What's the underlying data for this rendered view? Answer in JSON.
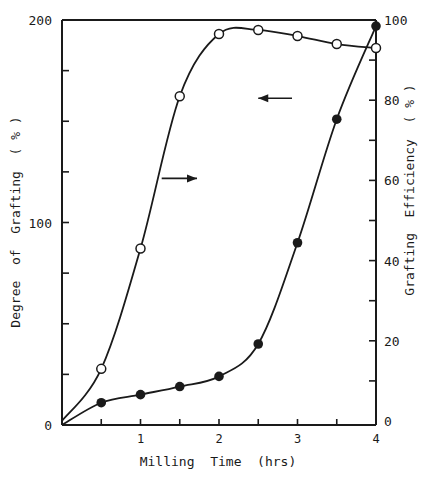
{
  "chart_data": {
    "type": "line",
    "title": "",
    "xlabel": "Milling Time (hrs)",
    "ylabel_left": "Degree of Grafting ( % )",
    "ylabel_right": "Grafting Efficiency ( % )",
    "x": [
      0,
      0.5,
      1,
      1.5,
      2,
      2.5,
      3,
      3.5,
      4
    ],
    "xlim": [
      0,
      4
    ],
    "ylim_left": [
      0,
      200
    ],
    "ylim_right": [
      0,
      100
    ],
    "x_ticks": [
      {
        "v": 0,
        "label": ""
      },
      {
        "v": 1,
        "label": "1"
      },
      {
        "v": 2,
        "label": "2"
      },
      {
        "v": 3,
        "label": "3"
      },
      {
        "v": 4,
        "label": "4"
      }
    ],
    "x_minor_ticks": [
      0.5,
      1,
      1.5,
      2,
      2.5,
      3,
      3.5
    ],
    "y_left_ticks": [
      {
        "v": 0,
        "label": "0"
      },
      {
        "v": 100,
        "label": "100"
      },
      {
        "v": 200,
        "label": "200"
      }
    ],
    "y_left_minor_ticks": [
      25,
      50,
      75,
      100,
      125,
      150,
      175
    ],
    "y_right_ticks": [
      {
        "v": 0,
        "label": "0"
      },
      {
        "v": 20,
        "label": "20"
      },
      {
        "v": 40,
        "label": "40"
      },
      {
        "v": 60,
        "label": "60"
      },
      {
        "v": 80,
        "label": "80"
      },
      {
        "v": 100,
        "label": "100"
      }
    ],
    "y_right_minor_ticks": [
      10,
      30,
      50,
      70,
      90
    ],
    "grid": false,
    "series": [
      {
        "name": "Grafting Efficiency",
        "axis": "right",
        "marker": "open-circle",
        "x": [
          0,
          0.5,
          1,
          1.5,
          2,
          2.5,
          3,
          3.5,
          4
        ],
        "values": [
          0,
          13,
          43,
          81,
          96.5,
          97.5,
          96,
          94,
          93
        ],
        "arrow": {
          "direction": "right",
          "from": [
            1.27,
            60.5
          ],
          "to": [
            1.72,
            60.5
          ]
        }
      },
      {
        "name": "Degree of Grafting",
        "axis": "left",
        "marker": "filled-circle",
        "x": [
          0,
          0.5,
          1,
          1.5,
          2,
          2.5,
          3,
          3.5,
          4
        ],
        "values": [
          0,
          11,
          15,
          19,
          24,
          40,
          90,
          151,
          197
        ],
        "arrow": {
          "direction": "left",
          "from": [
            2.93,
            80.5
          ],
          "to": [
            2.5,
            80.5
          ]
        }
      }
    ]
  },
  "labels": {
    "x_axis": "Milling  Time  (hrs)",
    "y_left": "Degree  of  Grafting  ( % )",
    "y_right": "Grafting  Efficiency  ( % )",
    "origin_left": "0"
  }
}
